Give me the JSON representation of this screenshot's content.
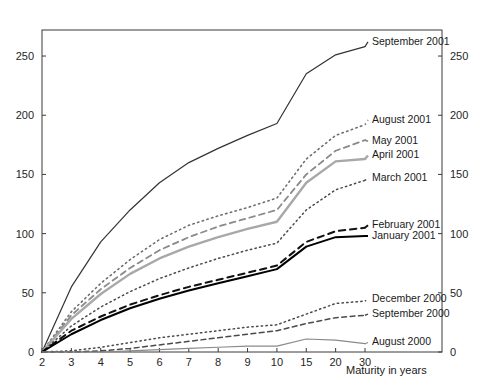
{
  "chart_data": {
    "type": "line",
    "title": "",
    "subtitle": "",
    "xlabel": "Maturity in years",
    "ylabel": "",
    "categories": [
      "2",
      "3",
      "4",
      "5",
      "6",
      "7",
      "8",
      "9",
      "10",
      "15",
      "20",
      "30"
    ],
    "x_tick_labels": [
      "2",
      "3",
      "4",
      "5",
      "6",
      "7",
      "8",
      "9",
      "10",
      "15",
      "20",
      "30"
    ],
    "y_tick_labels": [
      "0",
      "50",
      "100",
      "150",
      "200",
      "250"
    ],
    "y_ticks": [
      0,
      50,
      100,
      150,
      200,
      250
    ],
    "ylim": [
      0,
      272
    ],
    "grid": false,
    "legend_position": "right-inline-labels",
    "axis_mirrored": true,
    "note_x_axis_scale": "categorical / evenly spaced ticks",
    "series": [
      {
        "name": "September 2001",
        "label": "September 2001",
        "style": "solid",
        "color": "#333333",
        "width": 1.2,
        "label_y_value": 262,
        "values": [
          0,
          55,
          93,
          120,
          143,
          160,
          172,
          183,
          193,
          235,
          251,
          258
        ]
      },
      {
        "name": "August 2001",
        "label": "August 2001",
        "style": "dotted",
        "color": "#6e6e6e",
        "width": 1.6,
        "label_y_value": 196,
        "values": [
          0,
          34,
          58,
          78,
          95,
          107,
          115,
          122,
          130,
          163,
          183,
          192
        ]
      },
      {
        "name": "May 2001",
        "label": "May 2001",
        "style": "dashed",
        "color": "#8a8a8a",
        "width": 1.8,
        "label_y_value": 178,
        "values": [
          0,
          31,
          53,
          71,
          86,
          97,
          106,
          113,
          120,
          150,
          170,
          179
        ]
      },
      {
        "name": "April 2001",
        "label": "April 2001",
        "style": "solid",
        "color": "#a8a8a8",
        "width": 2.4,
        "label_y_value": 166,
        "values": [
          0,
          28,
          49,
          66,
          79,
          89,
          97,
          104,
          110,
          143,
          161,
          163
        ]
      },
      {
        "name": "March 2001",
        "label": "March 2001",
        "style": "dotted",
        "color": "#4a4a4a",
        "width": 1.5,
        "label_y_value": 147,
        "values": [
          0,
          22,
          38,
          51,
          62,
          71,
          79,
          86,
          92,
          120,
          137,
          145
        ]
      },
      {
        "name": "February 2001",
        "label": "February 2001",
        "style": "dashed",
        "color": "#111111",
        "width": 2.0,
        "label_y_value": 107,
        "values": [
          0,
          18,
          30,
          40,
          48,
          55,
          61,
          67,
          73,
          93,
          102,
          105
        ]
      },
      {
        "name": "January 2001",
        "label": "January 2001",
        "style": "solid",
        "color": "#000000",
        "width": 2.0,
        "label_y_value": 98,
        "values": [
          0,
          15,
          27,
          37,
          45,
          52,
          58,
          64,
          70,
          89,
          97,
          98
        ]
      },
      {
        "name": "December 2000",
        "label": "December 2000",
        "style": "dotted",
        "color": "#4a4a4a",
        "width": 1.5,
        "label_y_value": 45,
        "values": [
          0,
          1,
          4,
          8,
          12,
          15,
          18,
          21,
          23,
          32,
          41,
          43
        ]
      },
      {
        "name": "September 2000",
        "label": "September 2000",
        "style": "dashed",
        "color": "#4a4a4a",
        "width": 1.5,
        "label_y_value": 32,
        "values": [
          0,
          0,
          1,
          3,
          6,
          9,
          12,
          15,
          18,
          24,
          29,
          31
        ]
      },
      {
        "name": "August 2000",
        "label": "August 2000",
        "style": "solid",
        "color": "#8a8a8a",
        "width": 1.2,
        "label_y_value": 8,
        "values": [
          0,
          0,
          0,
          1,
          2,
          3,
          4,
          5,
          5,
          11,
          10,
          7
        ]
      }
    ]
  },
  "plot": {
    "left": 42,
    "top": 30,
    "right": 442,
    "bottom": 352,
    "series_x_right": 365,
    "label_x": 372
  }
}
